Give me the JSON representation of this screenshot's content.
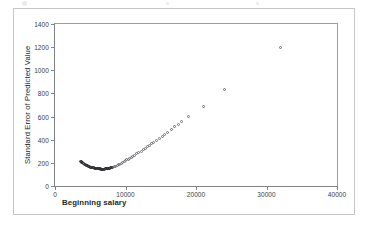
{
  "card": {
    "border_color": "#c3c6cb",
    "background": "#ffffff"
  },
  "chart_data": {
    "type": "scatter",
    "title": "",
    "xlabel": "Beginning salary",
    "ylabel": "Standard Error of Predicted Value",
    "xlim": [
      0,
      40000
    ],
    "ylim": [
      0,
      1400
    ],
    "grid": false,
    "legend": null,
    "marker": {
      "shape": "open-circle",
      "color": "#6e7176",
      "size_px": 3
    },
    "xticks": [
      0,
      10000,
      20000,
      30000,
      40000
    ],
    "xtick_labels": [
      "0",
      "10000",
      "20000",
      "30000",
      "40000"
    ],
    "yticks": [
      0,
      200,
      400,
      600,
      800,
      1000,
      1200,
      1400
    ],
    "ytick_labels": [
      "0",
      "200",
      "400",
      "600",
      "800",
      "1000",
      "1200",
      "1400"
    ],
    "points": [
      [
        3600,
        215
      ],
      [
        3700,
        211
      ],
      [
        3800,
        206
      ],
      [
        3900,
        201
      ],
      [
        4000,
        197
      ],
      [
        4100,
        193
      ],
      [
        4200,
        189
      ],
      [
        4300,
        185
      ],
      [
        4400,
        181
      ],
      [
        4500,
        177
      ],
      [
        4600,
        174
      ],
      [
        4700,
        171
      ],
      [
        4800,
        168
      ],
      [
        4900,
        166
      ],
      [
        5000,
        164
      ],
      [
        5100,
        162
      ],
      [
        5200,
        160
      ],
      [
        5300,
        158
      ],
      [
        5400,
        157
      ],
      [
        5500,
        156
      ],
      [
        5600,
        155
      ],
      [
        5700,
        153
      ],
      [
        5800,
        152
      ],
      [
        5900,
        151
      ],
      [
        6000,
        150
      ],
      [
        6100,
        149
      ],
      [
        6200,
        148
      ],
      [
        6300,
        147
      ],
      [
        6400,
        147
      ],
      [
        6500,
        146
      ],
      [
        6600,
        146
      ],
      [
        6700,
        146
      ],
      [
        6800,
        146
      ],
      [
        6900,
        146
      ],
      [
        7000,
        146
      ],
      [
        7100,
        147
      ],
      [
        7200,
        147
      ],
      [
        7300,
        148
      ],
      [
        7400,
        149
      ],
      [
        7500,
        150
      ],
      [
        7600,
        151
      ],
      [
        7700,
        152
      ],
      [
        7800,
        154
      ],
      [
        7900,
        156
      ],
      [
        8000,
        158
      ],
      [
        8200,
        162
      ],
      [
        8400,
        167
      ],
      [
        8600,
        172
      ],
      [
        8800,
        178
      ],
      [
        9000,
        184
      ],
      [
        9200,
        190
      ],
      [
        9400,
        197
      ],
      [
        9600,
        204
      ],
      [
        9800,
        211
      ],
      [
        10000,
        218
      ],
      [
        10200,
        225
      ],
      [
        10400,
        232
      ],
      [
        10600,
        240
      ],
      [
        10800,
        247
      ],
      [
        11000,
        255
      ],
      [
        11300,
        266
      ],
      [
        11600,
        278
      ],
      [
        11900,
        290
      ],
      [
        12200,
        302
      ],
      [
        12500,
        314
      ],
      [
        12800,
        327
      ],
      [
        13100,
        339
      ],
      [
        13400,
        352
      ],
      [
        13700,
        365
      ],
      [
        14000,
        378
      ],
      [
        14400,
        395
      ],
      [
        14800,
        413
      ],
      [
        15200,
        430
      ],
      [
        15600,
        448
      ],
      [
        16000,
        466
      ],
      [
        16500,
        489
      ],
      [
        17000,
        512
      ],
      [
        17500,
        535
      ],
      [
        18000,
        558
      ],
      [
        19000,
        600
      ],
      [
        21000,
        690
      ],
      [
        24000,
        830
      ],
      [
        32000,
        1200
      ]
    ]
  }
}
